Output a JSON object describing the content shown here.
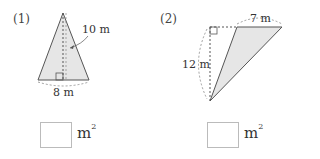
{
  "problems": [
    {
      "number": "(1)",
      "shape": "isosceles-triangle",
      "height_label": "10 m",
      "base_label": "8 m",
      "answer_value": "",
      "unit": "m",
      "unit_exponent": "2"
    },
    {
      "number": "(2)",
      "shape": "obtuse-triangle",
      "height_label": "12 m",
      "base_label": "7 m",
      "answer_value": "",
      "unit": "m",
      "unit_exponent": "2"
    }
  ],
  "colors": {
    "fill": "#e6e6e6",
    "stroke": "#555555",
    "box_border": "#bbbbbb"
  }
}
